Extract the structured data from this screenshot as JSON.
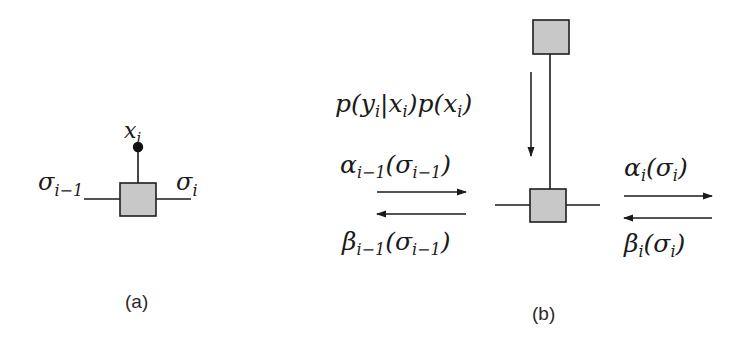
{
  "colors": {
    "line": "#1a1a1a",
    "factor_fill": "#c8c8c8",
    "factor_stroke": "#1f1f1f",
    "text": "#1a1a1a"
  },
  "panel_a": {
    "caption": "(a)",
    "variable_label": {
      "base": "x",
      "sub": "i"
    },
    "left_edge_label": {
      "base": "σ",
      "sub": "i−1"
    },
    "right_edge_label": {
      "base": "σ",
      "sub": "i"
    }
  },
  "panel_b": {
    "caption": "(b)",
    "evidence_message": {
      "parts": [
        "p(",
        "y",
        "i",
        "|",
        "x",
        "i",
        ")p(",
        "x",
        "i",
        ")"
      ],
      "text": "p(y_i|x_i)p(x_i)"
    },
    "alpha_left": {
      "func": "α",
      "sub": "i−1",
      "arg": "σ",
      "arg_sub": "i−1",
      "text": "α_{i−1}(σ_{i−1})"
    },
    "beta_left": {
      "func": "β",
      "sub": "i−1",
      "arg": "σ",
      "arg_sub": "i−1",
      "text": "β_{i−1}(σ_{i−1})"
    },
    "alpha_right": {
      "func": "α",
      "sub": "i",
      "arg": "σ",
      "arg_sub": "i",
      "text": "α_i(σ_i)"
    },
    "beta_right": {
      "func": "β",
      "sub": "i",
      "arg": "σ",
      "arg_sub": "i",
      "text": "β_i(σ_i)"
    }
  }
}
